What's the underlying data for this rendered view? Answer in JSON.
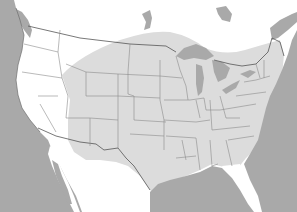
{
  "map": {
    "subject": "United States range map",
    "legend": [],
    "colors": {
      "water": "#a9a9a9",
      "land": "#ffffff",
      "range": "#dcdcdc",
      "state_border": "#8c8c8c",
      "coastline": "#6f6f6f"
    },
    "regions": [
      {
        "name": "shaded-range",
        "description": "Great Plains, Midwest, South and Northeast (excluding Florida peninsula and far western states)"
      }
    ]
  }
}
